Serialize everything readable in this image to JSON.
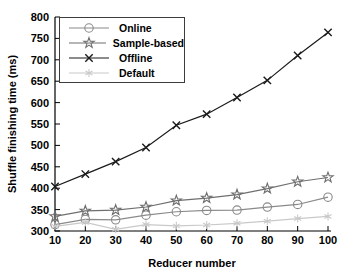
{
  "figure": {
    "width": 352,
    "height": 279,
    "background": "#ffffff",
    "axis_color": "#000000",
    "legend_border_color": "#3c3c3c"
  },
  "chart_data": {
    "type": "line",
    "title": "",
    "xlabel": "Reducer number",
    "ylabel": "Shuffle finishing time (ms)",
    "xlim": [
      10,
      100
    ],
    "ylim": [
      300,
      800
    ],
    "xticks": [
      10,
      20,
      30,
      40,
      50,
      60,
      70,
      80,
      90,
      100
    ],
    "yticks": [
      300,
      350,
      400,
      450,
      500,
      550,
      600,
      650,
      700,
      750,
      800
    ],
    "grid": false,
    "legend_position": "upper-left-inside",
    "x": [
      10,
      20,
      30,
      40,
      50,
      60,
      70,
      80,
      90,
      100
    ],
    "series": [
      {
        "name": "Online",
        "marker": "circle",
        "color": "#8a8a8a",
        "values": [
          315,
          327,
          326,
          337,
          345,
          348,
          349,
          356,
          362,
          379
        ]
      },
      {
        "name": "Sample-based",
        "marker": "star",
        "color": "#6f6f6f",
        "values": [
          334,
          347,
          349,
          356,
          371,
          377,
          385,
          399,
          415,
          425
        ]
      },
      {
        "name": "Offline",
        "marker": "x",
        "color": "#1a1a1a",
        "values": [
          404,
          433,
          462,
          495,
          547,
          573,
          612,
          652,
          710,
          764
        ]
      },
      {
        "name": "Default",
        "marker": "asterisk",
        "color": "#c9c9c9",
        "values": [
          311,
          320,
          304,
          315,
          312,
          314,
          318,
          323,
          329,
          334
        ]
      }
    ]
  }
}
